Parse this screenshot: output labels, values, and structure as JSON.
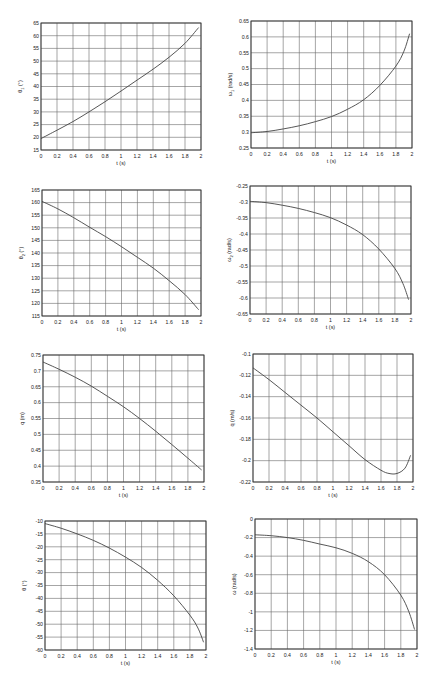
{
  "chart_data": [
    {
      "id": "theta1",
      "type": "line",
      "title": "",
      "xlabel": "t (s)",
      "ylabel": "θ₁ (°)",
      "ylabel_base": "θ",
      "ylabel_sub": "1",
      "ylabel_unit": "(°)",
      "xlim": [
        0,
        2
      ],
      "ylim": [
        15,
        65
      ],
      "xticks": [
        0,
        0.2,
        0.4,
        0.6,
        0.8,
        1,
        1.2,
        1.4,
        1.6,
        1.8,
        2
      ],
      "yticks": [
        15,
        20,
        25,
        30,
        35,
        40,
        45,
        50,
        55,
        60,
        65
      ],
      "grid": true,
      "x": [
        0,
        0.2,
        0.4,
        0.6,
        0.8,
        1.0,
        1.2,
        1.4,
        1.6,
        1.8,
        1.97
      ],
      "values": [
        19.5,
        22.8,
        26.2,
        30.0,
        34.0,
        38.2,
        42.5,
        46.8,
        51.5,
        57.0,
        63.2
      ],
      "box": {
        "left": 41,
        "top": 23,
        "right": 201,
        "bottom": 150
      }
    },
    {
      "id": "omega1",
      "type": "line",
      "title": "",
      "xlabel": "t (s)",
      "ylabel": "ω₁ (rad/s)",
      "ylabel_base": "ω",
      "ylabel_sub": "1",
      "ylabel_unit": "(rad/s)",
      "xlim": [
        0,
        2
      ],
      "ylim": [
        0.25,
        0.65
      ],
      "xticks": [
        0,
        0.2,
        0.4,
        0.6,
        0.8,
        1,
        1.2,
        1.4,
        1.6,
        1.8,
        2
      ],
      "yticks": [
        0.25,
        0.3,
        0.35,
        0.4,
        0.45,
        0.5,
        0.55,
        0.6,
        0.65
      ],
      "grid": true,
      "x": [
        0,
        0.2,
        0.4,
        0.6,
        0.8,
        1.0,
        1.2,
        1.4,
        1.6,
        1.8,
        1.9,
        1.97
      ],
      "values": [
        0.298,
        0.302,
        0.31,
        0.32,
        0.333,
        0.349,
        0.372,
        0.402,
        0.447,
        0.508,
        0.555,
        0.61
      ],
      "box": {
        "left": 251,
        "top": 21,
        "right": 412,
        "bottom": 148
      }
    },
    {
      "id": "theta2",
      "type": "line",
      "title": "",
      "xlabel": "t (s)",
      "ylabel": "θ₂ (°)",
      "ylabel_base": "θ",
      "ylabel_sub": "2",
      "ylabel_unit": "(°)",
      "xlim": [
        0,
        2
      ],
      "ylim": [
        115,
        165
      ],
      "xticks": [
        0,
        0.2,
        0.4,
        0.6,
        0.8,
        1,
        1.2,
        1.4,
        1.6,
        1.8,
        2
      ],
      "yticks": [
        115,
        120,
        125,
        130,
        135,
        140,
        145,
        150,
        155,
        160,
        165
      ],
      "grid": true,
      "x": [
        0,
        0.2,
        0.4,
        0.6,
        0.8,
        1.0,
        1.2,
        1.4,
        1.6,
        1.8,
        1.97
      ],
      "values": [
        160.5,
        157.5,
        154.0,
        150.2,
        146.5,
        142.5,
        138.3,
        134.0,
        129.0,
        123.5,
        117.5
      ],
      "box": {
        "left": 42,
        "top": 190,
        "right": 201,
        "bottom": 316
      }
    },
    {
      "id": "omega2",
      "type": "line",
      "title": "",
      "xlabel": "t (s)",
      "ylabel": "ω₂ (rad/s)",
      "ylabel_base": "ω",
      "ylabel_sub": "2",
      "ylabel_unit": "(rad/s)",
      "xlim": [
        0,
        2
      ],
      "ylim": [
        -0.65,
        -0.25
      ],
      "xticks": [
        0,
        0.2,
        0.4,
        0.6,
        0.8,
        1,
        1.2,
        1.4,
        1.6,
        1.8,
        2
      ],
      "yticks": [
        -0.65,
        -0.6,
        -0.55,
        -0.5,
        -0.45,
        -0.4,
        -0.35,
        -0.3,
        -0.25
      ],
      "grid": true,
      "x": [
        0,
        0.2,
        0.4,
        0.6,
        0.8,
        1.0,
        1.2,
        1.4,
        1.6,
        1.8,
        1.9,
        1.97
      ],
      "values": [
        -0.298,
        -0.302,
        -0.31,
        -0.32,
        -0.333,
        -0.349,
        -0.372,
        -0.402,
        -0.447,
        -0.508,
        -0.555,
        -0.605
      ],
      "box": {
        "left": 250,
        "top": 186,
        "right": 411,
        "bottom": 314
      }
    },
    {
      "id": "q",
      "type": "line",
      "title": "",
      "xlabel": "t (s)",
      "ylabel": "q (m)",
      "ylabel_base": "q",
      "ylabel_sub": "",
      "ylabel_unit": "(m)",
      "xlim": [
        0,
        2
      ],
      "ylim": [
        0.35,
        0.75
      ],
      "xticks": [
        0,
        0.2,
        0.4,
        0.6,
        0.8,
        1,
        1.2,
        1.4,
        1.6,
        1.8,
        2
      ],
      "yticks": [
        0.35,
        0.4,
        0.45,
        0.5,
        0.55,
        0.6,
        0.65,
        0.7,
        0.75
      ],
      "grid": true,
      "x": [
        0,
        0.2,
        0.4,
        0.6,
        0.8,
        1.0,
        1.2,
        1.4,
        1.6,
        1.8,
        1.97
      ],
      "values": [
        0.728,
        0.705,
        0.68,
        0.652,
        0.62,
        0.587,
        0.55,
        0.51,
        0.468,
        0.425,
        0.388
      ],
      "box": {
        "left": 43,
        "top": 355,
        "right": 204,
        "bottom": 482
      }
    },
    {
      "id": "qdot",
      "type": "line",
      "title": "",
      "xlabel": "t (s)",
      "ylabel": "q̇ (m/s)",
      "ylabel_base": "q̇",
      "ylabel_sub": "",
      "ylabel_unit": "(m/s)",
      "xlim": [
        0,
        2
      ],
      "ylim": [
        -0.22,
        -0.1
      ],
      "xticks": [
        0,
        0.2,
        0.4,
        0.6,
        0.8,
        1,
        1.2,
        1.4,
        1.6,
        1.8,
        2
      ],
      "yticks": [
        -0.22,
        -0.2,
        -0.18,
        -0.16,
        -0.14,
        -0.12,
        -0.1
      ],
      "grid": true,
      "x": [
        0,
        0.2,
        0.4,
        0.6,
        0.8,
        1.0,
        1.2,
        1.4,
        1.6,
        1.7,
        1.8,
        1.9,
        1.97
      ],
      "values": [
        -0.113,
        -0.124,
        -0.136,
        -0.148,
        -0.16,
        -0.173,
        -0.186,
        -0.199,
        -0.209,
        -0.212,
        -0.212,
        -0.207,
        -0.195
      ],
      "box": {
        "left": 253,
        "top": 354,
        "right": 413,
        "bottom": 482
      }
    },
    {
      "id": "theta",
      "type": "line",
      "title": "",
      "xlabel": "t (s)",
      "ylabel": "θ (°)",
      "ylabel_base": "θ",
      "ylabel_sub": "",
      "ylabel_unit": "(°)",
      "xlim": [
        0,
        2
      ],
      "ylim": [
        -60,
        -10
      ],
      "xticks": [
        0,
        0.2,
        0.4,
        0.6,
        0.8,
        1,
        1.2,
        1.4,
        1.6,
        1.8,
        2
      ],
      "yticks": [
        -60,
        -55,
        -50,
        -45,
        -40,
        -35,
        -30,
        -25,
        -20,
        -15,
        -10
      ],
      "grid": true,
      "x": [
        0,
        0.2,
        0.4,
        0.6,
        0.8,
        1.0,
        1.2,
        1.4,
        1.6,
        1.8,
        1.9,
        1.97
      ],
      "values": [
        -11.0,
        -12.8,
        -15.0,
        -17.5,
        -20.5,
        -24.0,
        -28.0,
        -33.0,
        -39.0,
        -46.5,
        -51.5,
        -57.0
      ],
      "box": {
        "left": 45,
        "top": 521,
        "right": 206,
        "bottom": 650
      }
    },
    {
      "id": "omega",
      "type": "line",
      "title": "",
      "xlabel": "t (s)",
      "ylabel": "ω (rad/s)",
      "ylabel_base": "ω",
      "ylabel_sub": "",
      "ylabel_unit": "(rad/s)",
      "xlim": [
        0,
        2
      ],
      "ylim": [
        -1.4,
        0
      ],
      "xticks": [
        0,
        0.2,
        0.4,
        0.6,
        0.8,
        1,
        1.2,
        1.4,
        1.6,
        1.8,
        2
      ],
      "yticks": [
        -1.4,
        -1.2,
        -1,
        -0.8,
        -0.6,
        -0.4,
        -0.2,
        0
      ],
      "grid": true,
      "x": [
        0,
        0.2,
        0.4,
        0.6,
        0.8,
        1.0,
        1.2,
        1.4,
        1.6,
        1.8,
        1.9,
        1.97
      ],
      "values": [
        -0.17,
        -0.18,
        -0.2,
        -0.23,
        -0.27,
        -0.31,
        -0.37,
        -0.46,
        -0.6,
        -0.82,
        -1.0,
        -1.19
      ],
      "box": {
        "left": 255,
        "top": 519,
        "right": 417,
        "bottom": 649
      }
    }
  ]
}
